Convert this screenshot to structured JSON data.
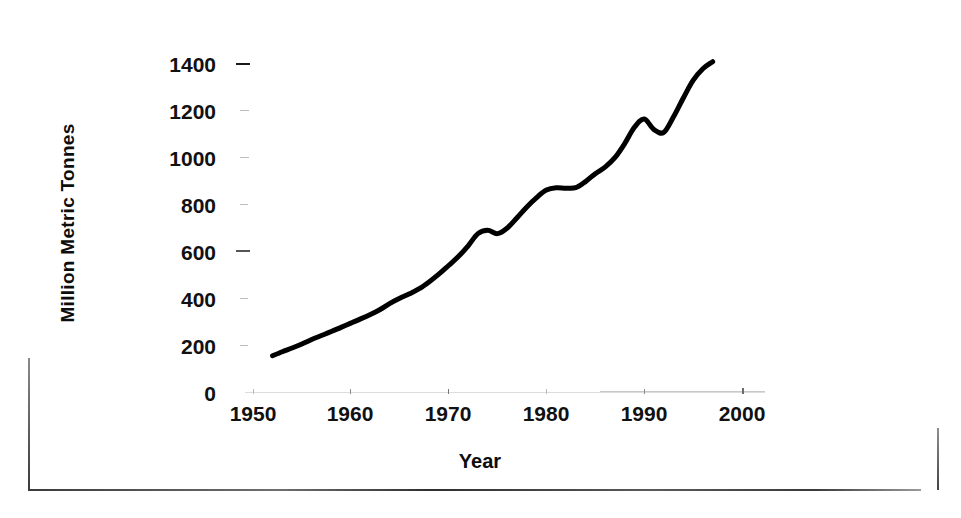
{
  "chart_data": {
    "type": "line",
    "title": "",
    "xlabel": "Year",
    "ylabel": "Million Metric Tonnes",
    "xlim": [
      1950,
      2000
    ],
    "ylim": [
      0,
      1400
    ],
    "grid": false,
    "legend": null,
    "xticks": [
      "1950",
      "1960",
      "1970",
      "1980",
      "1990",
      "2000"
    ],
    "xtick_values": [
      1950,
      1960,
      1970,
      1980,
      1990,
      2000
    ],
    "yticks": [
      "0",
      "200",
      "400",
      "600",
      "800",
      "1000",
      "1200",
      "1400"
    ],
    "ytick_values": [
      0,
      200,
      400,
      600,
      800,
      1000,
      1200,
      1400
    ],
    "series": [
      {
        "name": "Million Metric Tonnes",
        "color": "#000000",
        "line_width": 5,
        "x": [
          1952,
          1953,
          1954,
          1955,
          1956,
          1957,
          1958,
          1959,
          1960,
          1961,
          1962,
          1963,
          1964,
          1965,
          1966,
          1967,
          1968,
          1969,
          1970,
          1971,
          1972,
          1973,
          1974,
          1975,
          1976,
          1977,
          1978,
          1979,
          1980,
          1981,
          1982,
          1983,
          1984,
          1985,
          1986,
          1987,
          1988,
          1989,
          1990,
          1991,
          1992,
          1993,
          1994,
          1995,
          1996,
          1997
        ],
        "y": [
          155,
          172,
          188,
          205,
          224,
          241,
          258,
          276,
          294,
          312,
          331,
          352,
          378,
          400,
          419,
          441,
          470,
          503,
          540,
          578,
          624,
          676,
          690,
          676,
          700,
          744,
          790,
          830,
          862,
          872,
          870,
          872,
          898,
          932,
          960,
          1000,
          1060,
          1130,
          1165,
          1120,
          1108,
          1175,
          1255,
          1330,
          1380,
          1410
        ]
      }
    ],
    "annotations": []
  },
  "axis": {
    "y_axis_name": "Million Metric Tonnes",
    "x_axis_name": "Year"
  }
}
